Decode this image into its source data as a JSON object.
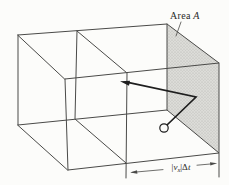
{
  "figure": {
    "type": "physics-diagram",
    "colors": {
      "bg": "#fcfcfa",
      "line": "#4a4a48",
      "arrow": "#1e1e1e",
      "wall-fill": "#dcdcd8",
      "wall-dot": "#b0b0ac",
      "text": "#2a2a28"
    },
    "labels": {
      "area": {
        "word": "Area",
        "symbol": "A"
      },
      "distance": {
        "open": "|",
        "v": "v",
        "sub": "x",
        "close": "|",
        "delta": "Δ",
        "t": "t"
      }
    }
  }
}
